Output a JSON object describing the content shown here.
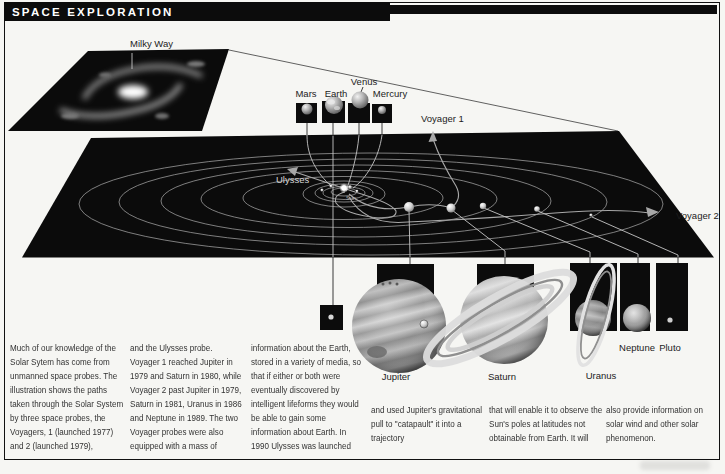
{
  "title": "SPACE EXPLORATION",
  "galaxy": {
    "label": "Milky Way"
  },
  "diagram": {
    "sun": "Sun",
    "ulysses": "Ulysses",
    "voyager1": "Voyager 1",
    "voyager2": "Voyager 2",
    "inner_planets": [
      {
        "name": "Mars"
      },
      {
        "name": "Earth"
      },
      {
        "name": "Venus"
      },
      {
        "name": "Mercury"
      }
    ],
    "outer_planets": [
      {
        "name": "Jupiter"
      },
      {
        "name": "Saturn"
      },
      {
        "name": "Uranus"
      },
      {
        "name": "Neptune"
      },
      {
        "name": "Pluto"
      }
    ]
  },
  "body": {
    "columns": [
      "Much of our knowledge of the Solar Sytem has come from unmanned space probes. The illustration shows the paths taken through the Solar System by three space probes, the Voyagers, 1 (launched 1977) and 2 (launched 1979),",
      "and the Ulysses probe. Voyager 1 reached Jupiter in 1979 and Saturn in 1980, while Voyager 2 past Jupiter in 1979, Saturn in 1981, Uranus in 1986 and Neptune in 1989. The two Voyager probes were also equipped with a mass of",
      "information about the Earth, stored in a variety of media, so that if either or both were eventually discovered by intelligent lifeforms they would be able to gain some information about Earth. In 1990 Ulysses was launched",
      "and used Jupiter's gravitational pull to \"catapault\" it into a trajectory",
      "that will enable it to observe the Sun's poles at latitudes not obtainable from Earth. It will",
      "also provide information on solar wind and other solar phenomenon."
    ]
  },
  "colors": {
    "paper": "#f6f6f3",
    "ink": "#111111",
    "orbit": "#b0b0b0",
    "trajectory": "#a8a8a8"
  }
}
